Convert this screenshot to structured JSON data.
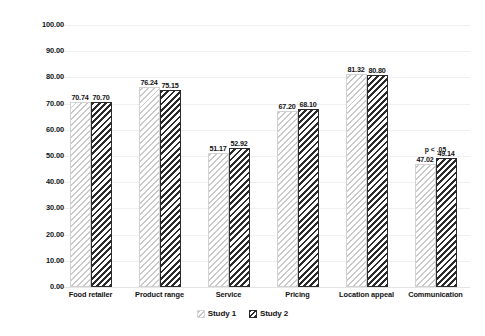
{
  "chart_data": {
    "type": "bar",
    "title": "",
    "xlabel": "",
    "ylabel": "",
    "categories": [
      "Food retailer",
      "Product range",
      "Service",
      "Pricing",
      "Location appeal",
      "Communication"
    ],
    "series": [
      {
        "name": "Study 1",
        "values": [
          70.74,
          76.24,
          51.17,
          67.2,
          81.32,
          47.02
        ],
        "labels": [
          "70.74",
          "76.24",
          "51.17",
          "67.20",
          "81.32",
          "47.02"
        ],
        "fill": "light-diagonal-hatch",
        "color": "#c9c9c9"
      },
      {
        "name": "Study 2",
        "values": [
          70.7,
          75.15,
          52.92,
          68.1,
          80.8,
          49.14
        ],
        "labels": [
          "70.70",
          "75.15",
          "52.92",
          "68.10",
          "80.80",
          "49.14"
        ],
        "fill": "dark-diagonal-hatch",
        "color": "#2b2b2b"
      }
    ],
    "ylim": [
      0,
      100
    ],
    "ytick_values": [
      0,
      10,
      20,
      30,
      40,
      50,
      60,
      70,
      80,
      90,
      100
    ],
    "ytick_labels": [
      "0.00",
      "10.00",
      "20.00",
      "30.00",
      "40.00",
      "50.00",
      "60.00",
      "70.00",
      "80.00",
      "90.00",
      "100.00"
    ],
    "grid": true,
    "legend_position": "bottom",
    "annotations": [
      {
        "text": "p < .05",
        "category": "Communication",
        "value": 54.0
      }
    ]
  },
  "legend": {
    "items": [
      {
        "label": "Study 1",
        "swatch": "light-hatch-swatch"
      },
      {
        "label": "Study 2",
        "swatch": "dark-hatch-swatch"
      }
    ]
  }
}
